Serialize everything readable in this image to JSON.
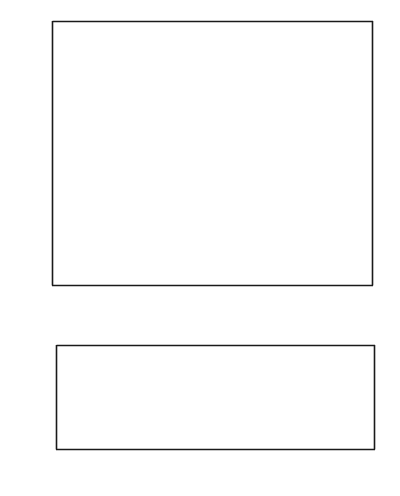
{
  "figure": {
    "title": "",
    "panels": [
      "top-heat-flow-profile",
      "bottom-log-heat-flow-profile"
    ]
  },
  "chart_data": [
    {
      "id": "top-panel",
      "type": "scatter",
      "title": "",
      "xlabel": "Distance (km)",
      "ylabel": "Heat flow (mWm-2)",
      "ylabel_base": "Heat flow (mWm",
      "ylabel_sup": "-2",
      "ylabel_tail": ")",
      "xlim": [
        -38.5,
        39.0
      ],
      "ylim": [
        0,
        120
      ],
      "xticks": [
        -30,
        -20,
        -10,
        0,
        10,
        20,
        30
      ],
      "xticklabels": [
        "-30",
        "-20",
        "-10",
        "0",
        "10",
        "20",
        "30"
      ],
      "yticks": [
        0,
        20,
        40,
        60,
        80,
        100,
        120
      ],
      "yticklabels": [
        "0",
        "20",
        "40",
        "60",
        "80",
        "100",
        "120"
      ],
      "grid": false,
      "legend": null,
      "point_color": "#bdbdbd",
      "series": [
        {
          "name": "Heat flow measurements",
          "style": "scatter-gray-circles",
          "points": [
            [
              -35.4,
              80.3
            ],
            [
              -32.0,
              66.5
            ],
            [
              -30.8,
              68.3
            ],
            [
              -28.0,
              99.2
            ],
            [
              -27.8,
              95.4
            ],
            [
              -27.2,
              50.8
            ],
            [
              -17.3,
              109.0
            ],
            [
              -15.8,
              86.0
            ],
            [
              -15.6,
              85.3
            ],
            [
              -15.2,
              80.6
            ],
            [
              -13.6,
              69.0
            ],
            [
              -12.2,
              86.0
            ],
            [
              -11.4,
              96.6
            ],
            [
              -11.1,
              97.3
            ],
            [
              -9.9,
              103.7
            ],
            [
              -7.6,
              61.4
            ],
            [
              -6.7,
              82.0
            ],
            [
              -6.2,
              71.8
            ],
            [
              -5.6,
              67.2
            ],
            [
              -5.2,
              59.6
            ],
            [
              -4.4,
              74.2
            ],
            [
              -4.3,
              66.8
            ],
            [
              -4.1,
              67.8
            ],
            [
              -4.0,
              72.8
            ],
            [
              -3.6,
              89.0
            ],
            [
              -3.3,
              68.3
            ],
            [
              -3.1,
              95.2
            ],
            [
              -2.9,
              66.6
            ],
            [
              -2.5,
              74.8
            ],
            [
              -2.2,
              79.3
            ],
            [
              -1.8,
              73.5
            ],
            [
              -1.3,
              45.6
            ],
            [
              -0.4,
              90.8
            ],
            [
              0.6,
              99.8
            ],
            [
              1.0,
              94.8
            ],
            [
              1.5,
              86.0
            ],
            [
              1.9,
              83.0
            ],
            [
              2.2,
              79.7
            ],
            [
              2.6,
              62.4
            ],
            [
              2.9,
              80.7
            ],
            [
              3.1,
              85.6
            ],
            [
              3.4,
              87.7
            ],
            [
              4.3,
              62.1
            ],
            [
              4.6,
              77.9
            ],
            [
              4.9,
              77.4
            ],
            [
              5.2,
              76.6
            ],
            [
              5.6,
              64.8
            ],
            [
              5.9,
              96.6
            ],
            [
              6.1,
              55.3
            ],
            [
              6.4,
              43.6
            ],
            [
              7.6,
              99.0
            ],
            [
              8.2,
              84.4
            ],
            [
              8.8,
              86.4
            ],
            [
              9.0,
              66.9
            ],
            [
              11.6,
              54.1
            ],
            [
              12.6,
              43.3
            ],
            [
              15.9,
              85.3
            ],
            [
              16.4,
              88.0
            ],
            [
              17.2,
              46.6
            ],
            [
              18.0,
              68.2
            ],
            [
              18.6,
              91.4
            ],
            [
              19.1,
              92.0
            ],
            [
              19.4,
              68.3
            ],
            [
              20.2,
              81.3
            ],
            [
              20.4,
              68.2
            ],
            [
              21.3,
              89.8
            ],
            [
              21.6,
              67.9
            ],
            [
              22.0,
              99.0
            ],
            [
              25.7,
              61.0
            ],
            [
              26.4,
              61.6
            ],
            [
              26.9,
              75.2
            ],
            [
              30.9,
              69.8
            ],
            [
              35.3,
              50.7
            ],
            [
              36.1,
              26.9
            ],
            [
              38.2,
              76.0
            ]
          ]
        },
        {
          "name": "Model curve (solid)",
          "style": "solid-line",
          "peak_value": 109.0,
          "baseline_value": 73.5,
          "peak_x": 0,
          "halfwidth_km": 3.0
        },
        {
          "name": "Model curve (dotted)",
          "style": "dotted-line",
          "peak_value": 93.3,
          "baseline_value": 73.0,
          "peak_x": -0.6,
          "halfwidth_km": 6.0
        }
      ]
    },
    {
      "id": "bottom-panel",
      "type": "line",
      "title": "",
      "xlabel": "Distance (km)",
      "ylabel": "Heat flow (mWm-2)",
      "ylabel_base": "Heat flow (mWm",
      "ylabel_sup": "-2",
      "ylabel_tail": ")",
      "xlim": [
        -60,
        60
      ],
      "ylim_log10": [
        -0.75,
        4.0
      ],
      "yscale": "log",
      "xticks": [
        -60,
        -40,
        -20,
        0,
        20,
        40,
        60
      ],
      "xticklabels": [
        "60",
        "40",
        "20",
        "0",
        "20",
        "40",
        "60"
      ],
      "yticks_log10": [
        0,
        2,
        4
      ],
      "yticklabels": [
        "10",
        "10",
        "10"
      ],
      "yticklabel_sups": [
        "0",
        "2",
        "4"
      ],
      "yminor_ticks_log10": [
        1,
        3
      ],
      "grid": false,
      "annotations": [
        {
          "text": "Mid-ocean ridge",
          "x_km": 8,
          "y_log10": 3.28
        },
        {
          "text": "Strike-slip fault",
          "x_km": 13,
          "y_log10": 1.62
        }
      ],
      "series": [
        {
          "name": "Mid-ocean ridge",
          "style": "solid-line",
          "peak_log10": 3.78,
          "edge_log10": 2.28,
          "shape": "sharp-cusp"
        },
        {
          "name": "Strike-slip fault",
          "style": "solid-line",
          "peak_log10": 1.49,
          "edge_log10": -0.42,
          "shape": "broad-cusp"
        }
      ]
    }
  ]
}
